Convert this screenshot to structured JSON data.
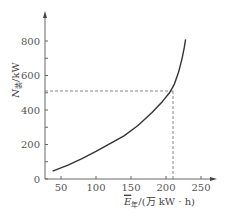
{
  "chart_data": {
    "type": "line",
    "title": "",
    "xlabel": "E年/(万 kW·h)",
    "ylabel": "N装/kW",
    "xlim": [
      30,
      255
    ],
    "ylim": [
      0,
      880
    ],
    "x_ticks": [
      "50",
      "100",
      "150",
      "200",
      "250"
    ],
    "y_ticks": [
      "0",
      "200",
      "400",
      "600",
      "800"
    ],
    "grid": false,
    "series": [
      {
        "name": "N装 vs E年",
        "x": [
          38,
          60,
          80,
          100,
          120,
          140,
          160,
          180,
          195,
          205,
          212,
          218,
          223,
          226,
          228
        ],
        "y": [
          45,
          80,
          118,
          160,
          205,
          250,
          310,
          385,
          450,
          500,
          550,
          620,
          700,
          760,
          810
        ]
      }
    ],
    "annotations": [
      {
        "type": "dashed-horizontal",
        "y": 510,
        "from_x": 30,
        "to_x": 210
      },
      {
        "type": "dashed-vertical",
        "x": 210,
        "from_y": 0,
        "to_y": 510
      }
    ]
  },
  "labels": {
    "y_axis_symbol": "N",
    "y_axis_sub": "装",
    "y_axis_unit": "/kW",
    "x_axis_symbol": "E",
    "x_axis_sub": "年",
    "x_axis_unit": "/(万 kW · h)"
  }
}
